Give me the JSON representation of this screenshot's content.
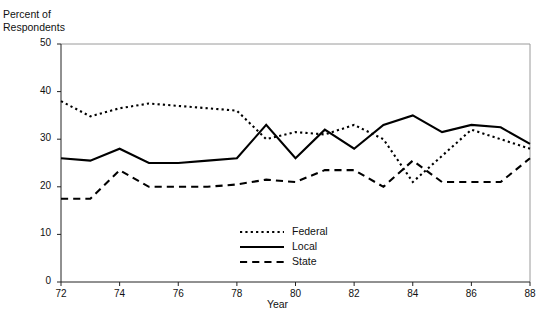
{
  "chart_data": {
    "type": "line",
    "title": "",
    "xlabel": "Year",
    "ylabel": "Percent of\nRespondents",
    "ylabel_line1": "Percent of",
    "ylabel_line2": "Respondents",
    "xlim": [
      72,
      88
    ],
    "ylim": [
      0,
      50
    ],
    "xticks": [
      72,
      74,
      76,
      78,
      80,
      82,
      84,
      86,
      88
    ],
    "xtick_labels": [
      "72",
      "74",
      "76",
      "78",
      "80",
      "82",
      "84",
      "86",
      "88"
    ],
    "yticks": [
      0,
      10,
      20,
      30,
      40,
      50
    ],
    "ytick_labels": [
      "0",
      "10",
      "20",
      "30",
      "40",
      "50"
    ],
    "grid": false,
    "legend_position": "bottom-center",
    "x": [
      72,
      73,
      74,
      75,
      76,
      77,
      78,
      79,
      80,
      81,
      82,
      83,
      84,
      85,
      86,
      87,
      88
    ],
    "series": [
      {
        "name": "Federal",
        "style": "dotted",
        "color": "#000000",
        "values": [
          38,
          34.8,
          36.5,
          37.5,
          37,
          36.5,
          36,
          30,
          31.5,
          31,
          33,
          30,
          21,
          26.5,
          32,
          30,
          28
        ]
      },
      {
        "name": "Local",
        "style": "solid",
        "color": "#000000",
        "values": [
          26,
          25.5,
          28,
          25,
          25,
          25.5,
          26,
          33,
          26,
          32,
          28,
          33,
          35,
          31.5,
          33,
          32.5,
          29
        ]
      },
      {
        "name": "State",
        "style": "dashed",
        "color": "#000000",
        "values": [
          17.5,
          17.5,
          23.5,
          20,
          20,
          20,
          20.5,
          21.5,
          21,
          23.5,
          23.5,
          20,
          25.5,
          21,
          21,
          21,
          26
        ]
      }
    ]
  },
  "legend": {
    "items": [
      {
        "label": "Federal",
        "style": "dotted"
      },
      {
        "label": "Local",
        "style": "solid"
      },
      {
        "label": "State",
        "style": "dashed"
      }
    ]
  }
}
